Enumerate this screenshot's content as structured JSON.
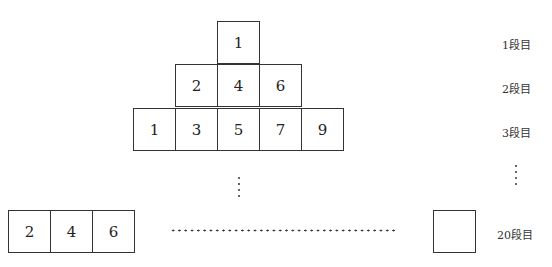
{
  "rows": [
    {
      "label": "1段目",
      "cells": [
        "1"
      ]
    },
    {
      "label": "2段目",
      "cells": [
        "2",
        "4",
        "6"
      ]
    },
    {
      "label": "3段目",
      "cells": [
        "1",
        "3",
        "5",
        "7",
        "9"
      ]
    }
  ],
  "last_row": {
    "label": "20段目",
    "cells": [
      "2",
      "4",
      "6"
    ],
    "last_cell": ""
  },
  "ellipsis": {
    "vertical": "⋮",
    "horizontal": "……"
  }
}
